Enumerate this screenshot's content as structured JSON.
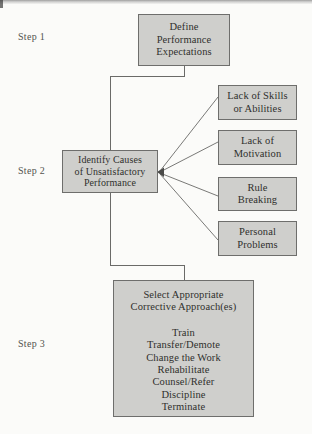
{
  "diagram": {
    "background_color": "#fbfbf9",
    "node_fill_color": "#cfcfcc",
    "node_border_color": "#6e6e6c",
    "text_color": "#2f2f2d"
  },
  "steps": [
    {
      "label": "Step 1"
    },
    {
      "label": "Step 2"
    },
    {
      "label": "Step 3"
    }
  ],
  "nodes": {
    "define": {
      "name": "define-performance-expectations",
      "lines": [
        "Define",
        "Performance",
        "Expectations"
      ]
    },
    "identify": {
      "name": "identify-causes-of-unsatisfactory-performance",
      "lines": [
        "Identify Causes",
        "of Unsatisfactory",
        "Performance"
      ]
    },
    "causes": [
      {
        "name": "lack-of-skills-or-abilities",
        "lines": [
          "Lack of Skills",
          "or Abilities"
        ]
      },
      {
        "name": "lack-of-motivation",
        "lines": [
          "Lack of",
          "Motivation"
        ]
      },
      {
        "name": "rule-breaking",
        "lines": [
          "Rule",
          "Breaking"
        ]
      },
      {
        "name": "personal-problems",
        "lines": [
          "Personal",
          "Problems"
        ]
      }
    ],
    "select": {
      "name": "select-appropriate-corrective-approaches",
      "heading": [
        "Select Appropriate",
        "Corrective Approach(es)"
      ],
      "options": [
        "Train",
        "Transfer/Demote",
        "Change the Work",
        "Rehabilitate",
        "Counsel/Refer",
        "Discipline",
        "Terminate"
      ]
    }
  },
  "connectors": {
    "define_to_identify": "elbow down-left into top of Identify Causes",
    "identify_to_select": "elbow down-right into top of Select Appropriate",
    "fan_out": "four diagonal lines from the four cause boxes converging to an arrowhead on the right edge of Identify Causes"
  }
}
